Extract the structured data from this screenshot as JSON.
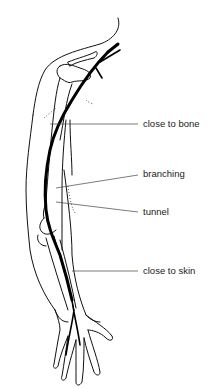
{
  "figure": {
    "labels": [
      {
        "id": "close-to-bone",
        "text": "close to bone"
      },
      {
        "id": "branching",
        "text": "branching"
      },
      {
        "id": "tunnel",
        "text": "tunnel"
      },
      {
        "id": "close-to-skin",
        "text": "close to skin"
      }
    ]
  }
}
